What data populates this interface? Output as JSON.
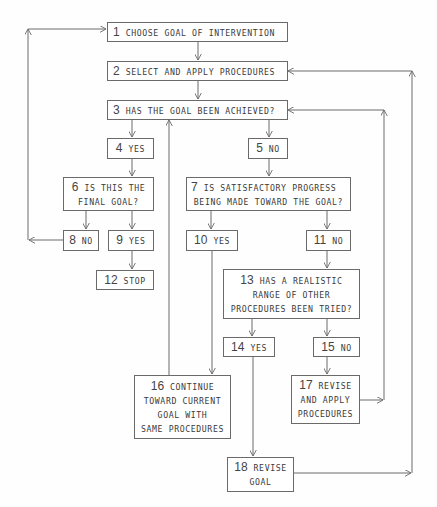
{
  "diagram": {
    "type": "flowchart",
    "nodes": [
      {
        "id": "1",
        "num": "1",
        "lines": [
          "CHOOSE GOAL OF INTERVENTION"
        ]
      },
      {
        "id": "2",
        "num": "2",
        "lines": [
          "SELECT AND APPLY PROCEDURES"
        ]
      },
      {
        "id": "3",
        "num": "3",
        "lines": [
          "HAS THE GOAL BEEN ACHIEVED?"
        ]
      },
      {
        "id": "4",
        "num": "4",
        "lines": [
          "YES"
        ]
      },
      {
        "id": "5",
        "num": "5",
        "lines": [
          "NO"
        ]
      },
      {
        "id": "6",
        "num": "6",
        "lines": [
          "IS THIS THE",
          "FINAL GOAL?"
        ]
      },
      {
        "id": "7",
        "num": "7",
        "lines": [
          "IS SATISFACTORY PROGRESS",
          "BEING MADE TOWARD THE GOAL?"
        ]
      },
      {
        "id": "8",
        "num": "8",
        "lines": [
          "NO"
        ]
      },
      {
        "id": "9",
        "num": "9",
        "lines": [
          "YES"
        ]
      },
      {
        "id": "10",
        "num": "10",
        "lines": [
          "YES"
        ]
      },
      {
        "id": "11",
        "num": "11",
        "lines": [
          "NO"
        ]
      },
      {
        "id": "12",
        "num": "12",
        "lines": [
          "STOP"
        ]
      },
      {
        "id": "13",
        "num": "13",
        "lines": [
          "HAS A REALISTIC",
          "RANGE OF OTHER",
          "PROCEDURES BEEN TRIED?"
        ]
      },
      {
        "id": "14",
        "num": "14",
        "lines": [
          "YES"
        ]
      },
      {
        "id": "15",
        "num": "15",
        "lines": [
          "NO"
        ]
      },
      {
        "id": "16",
        "num": "16",
        "lines": [
          "CONTINUE",
          "TOWARD CURRENT",
          "GOAL WITH",
          "SAME PROCEDURES"
        ]
      },
      {
        "id": "17",
        "num": "17",
        "lines": [
          "REVISE",
          "AND APPLY",
          "PROCEDURES"
        ]
      },
      {
        "id": "18",
        "num": "18",
        "lines": [
          "REVISE",
          "GOAL"
        ]
      }
    ],
    "edges": [
      [
        "1",
        "2"
      ],
      [
        "2",
        "3"
      ],
      [
        "3",
        "4"
      ],
      [
        "3",
        "5"
      ],
      [
        "4",
        "6"
      ],
      [
        "5",
        "7"
      ],
      [
        "6",
        "8"
      ],
      [
        "6",
        "9"
      ],
      [
        "9",
        "12"
      ],
      [
        "8",
        "1"
      ],
      [
        "7",
        "10"
      ],
      [
        "7",
        "11"
      ],
      [
        "10",
        "16"
      ],
      [
        "16",
        "3"
      ],
      [
        "11",
        "13"
      ],
      [
        "13",
        "14"
      ],
      [
        "13",
        "15"
      ],
      [
        "15",
        "17"
      ],
      [
        "17",
        "3"
      ],
      [
        "14",
        "18"
      ],
      [
        "18",
        "2"
      ]
    ],
    "colors": {
      "line": "#6a6a6a",
      "text": "#3a3a3a",
      "background": "#fefefe"
    }
  }
}
